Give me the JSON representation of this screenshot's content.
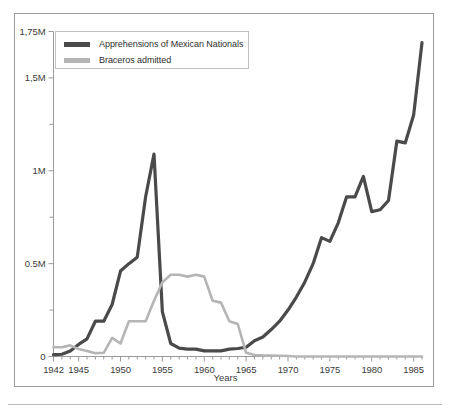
{
  "chart_data": {
    "type": "line",
    "title": "",
    "xlabel": "Years",
    "ylabel": "",
    "xlim": [
      1942,
      1986
    ],
    "ylim": [
      0,
      1750000
    ],
    "grid": false,
    "legend_position": "top-left",
    "y_tick_labels": [
      "0",
      "0.5M",
      "1M",
      "1,5M",
      "1,75M"
    ],
    "y_tick_values": [
      0,
      500000,
      1000000,
      1500000,
      1750000
    ],
    "y_minor_tick_values": [
      250000,
      750000,
      1250000
    ],
    "x_tick_labels": [
      "1942",
      "1945",
      "1950",
      "1955",
      "1960",
      "1965",
      "1970",
      "1975",
      "1980",
      "1985"
    ],
    "x_tick_values": [
      1942,
      1945,
      1950,
      1955,
      1960,
      1965,
      1970,
      1975,
      1980,
      1985
    ],
    "colors": {
      "apprehensions": "#4a4a4a",
      "braceros": "#b5b5b5",
      "axis": "#9a9a9a",
      "frame": "#9a9a9a",
      "text": "#3b3b3b"
    },
    "x": [
      1942,
      1943,
      1944,
      1945,
      1946,
      1947,
      1948,
      1949,
      1950,
      1951,
      1952,
      1953,
      1954,
      1955,
      1956,
      1957,
      1958,
      1959,
      1960,
      1961,
      1962,
      1963,
      1964,
      1965,
      1966,
      1967,
      1968,
      1969,
      1970,
      1971,
      1972,
      1973,
      1974,
      1975,
      1976,
      1977,
      1978,
      1979,
      1980,
      1981,
      1982,
      1983,
      1984,
      1985,
      1986
    ],
    "series": [
      {
        "name": "Apprehensions of Mexican Nationals",
        "color": "#4a4a4a",
        "values": [
          10000,
          12000,
          30000,
          65000,
          95000,
          190000,
          190000,
          280000,
          460000,
          500000,
          535000,
          860000,
          1090000,
          240000,
          70000,
          45000,
          40000,
          40000,
          30000,
          30000,
          30000,
          40000,
          43000,
          50000,
          85000,
          105000,
          145000,
          190000,
          250000,
          320000,
          400000,
          500000,
          640000,
          620000,
          720000,
          860000,
          860000,
          970000,
          780000,
          790000,
          840000,
          1160000,
          1150000,
          1300000,
          1690000
        ]
      },
      {
        "name": "Braceros admitted",
        "color": "#b5b5b5",
        "values": [
          50000,
          50000,
          60000,
          40000,
          30000,
          18000,
          20000,
          100000,
          70000,
          190000,
          190000,
          190000,
          300000,
          400000,
          440000,
          440000,
          430000,
          440000,
          430000,
          300000,
          290000,
          190000,
          175000,
          20000,
          8000,
          6000,
          5000,
          4000,
          3000,
          0,
          0,
          0,
          0,
          0,
          0,
          0,
          0,
          0,
          0,
          0,
          0,
          0,
          0,
          0,
          0
        ]
      }
    ]
  },
  "legend": {
    "items": [
      {
        "label": "Apprehensions of Mexican Nationals"
      },
      {
        "label": "Braceros admitted"
      }
    ]
  },
  "axis": {
    "x_title": "Years"
  }
}
